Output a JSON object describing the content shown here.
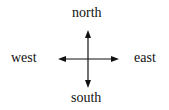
{
  "diagram": {
    "type": "compass-directions",
    "labels": {
      "north": "north",
      "south": "south",
      "west": "west",
      "east": "east"
    },
    "arrow_color": "#111111",
    "background": "#ffffff"
  }
}
